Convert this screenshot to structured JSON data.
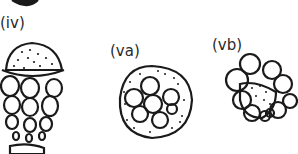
{
  "figure": {
    "labels": {
      "iv": "(iv)",
      "va": "(va)",
      "vb": "(vb)"
    },
    "colors": {
      "ink": "#1a1a1a",
      "background": "#ffffff"
    }
  }
}
